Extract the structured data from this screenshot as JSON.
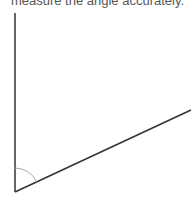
{
  "prompt": {
    "text": "measure the angle accurately."
  },
  "diagram": {
    "type": "angle",
    "vertex": [
      15,
      192
    ],
    "ray_vertical_end": [
      15,
      13
    ],
    "ray_slanted_end": [
      191,
      110
    ],
    "arc_radius": 24,
    "line_color": "#333333",
    "arc_color": "#aaaaaa"
  }
}
